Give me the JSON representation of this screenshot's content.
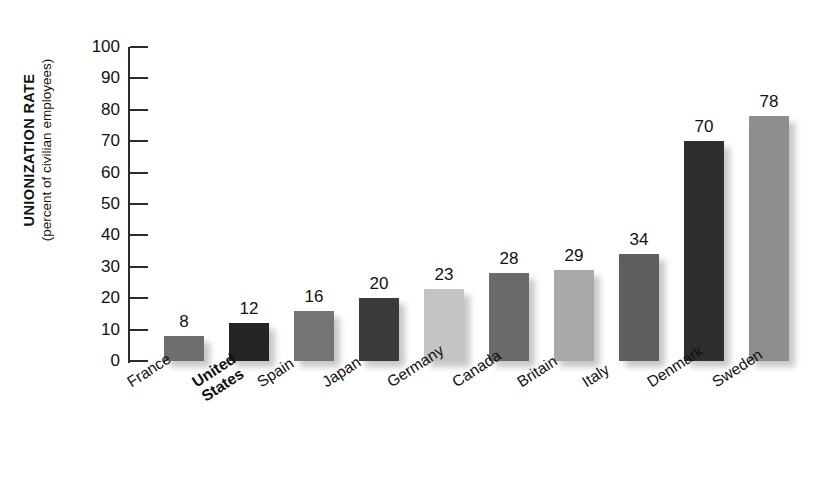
{
  "chart_data": {
    "type": "bar",
    "title": "",
    "subtitle": "",
    "xlabel": "",
    "ylabel": "UNIONIZATION RATE",
    "ylabel_sub": "(percent of civilian employees)",
    "ylim": [
      0,
      100
    ],
    "yticks": [
      "100",
      "90",
      "80",
      "70",
      "60",
      "50",
      "40",
      "30",
      "20",
      "10",
      "0"
    ],
    "grid": false,
    "legend": "none",
    "categories": [
      "France",
      "United\nStates",
      "Spain",
      "Japan",
      "Germany",
      "Canada",
      "Britain",
      "Italy",
      "Denmark",
      "Sweden"
    ],
    "values": [
      8,
      12,
      16,
      20,
      23,
      28,
      29,
      34,
      70,
      78
    ],
    "value_labels": [
      "8",
      "12",
      "16",
      "20",
      "23",
      "28",
      "29",
      "34",
      "70",
      "78"
    ],
    "bar_colors": [
      "#6e6e6e",
      "#242424",
      "#747474",
      "#3a3a3a",
      "#c4c4c4",
      "#6a6a6a",
      "#a8a8a8",
      "#5e5e5e",
      "#2e2e2e",
      "#8e8e8e"
    ],
    "highlighted_category": "United States",
    "axis_color": "#2b2b2b",
    "background_color": "#ffffff",
    "text_color": "#111111"
  }
}
